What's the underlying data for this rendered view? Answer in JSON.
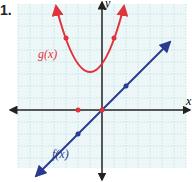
{
  "problem_number": "1.",
  "graph": {
    "x_axis_label": "x",
    "y_axis_label": "y",
    "grid_color": "#b9dde0",
    "axis_color": "#222222",
    "functions": [
      {
        "name": "g(x)",
        "label": "g(x)",
        "type": "parabola",
        "color": "#e0343c",
        "vertex": [
          -1,
          -1
        ],
        "points": [
          [
            -2,
            0
          ],
          [
            0,
            0
          ],
          [
            -3,
            3
          ],
          [
            1,
            3
          ]
        ]
      },
      {
        "name": "f(x)",
        "label": "f(x)",
        "type": "line",
        "color": "#2a3a8f",
        "points": [
          [
            -2,
            -2
          ],
          [
            2,
            2
          ]
        ]
      }
    ]
  }
}
